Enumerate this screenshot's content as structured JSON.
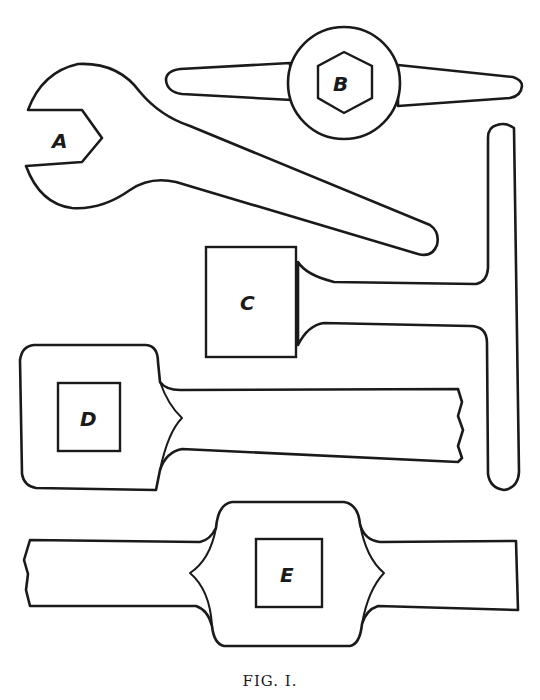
{
  "figure": {
    "caption": "FIG. I.",
    "stroke_color": "#1a1a1a",
    "background": "#ffffff",
    "tools": [
      {
        "id": "A",
        "label": "A",
        "description": "open-ended spanner with hexagonal jaw"
      },
      {
        "id": "B",
        "label": "B",
        "description": "T-handled socket key with hexagonal socket"
      },
      {
        "id": "C",
        "label": "C",
        "description": "T-handle key with square head"
      },
      {
        "id": "D",
        "label": "D",
        "description": "square-socket spanner with broken-off handle"
      },
      {
        "id": "E",
        "label": "E",
        "description": "double-ended square-socket spanner, both ends broken off"
      }
    ]
  }
}
